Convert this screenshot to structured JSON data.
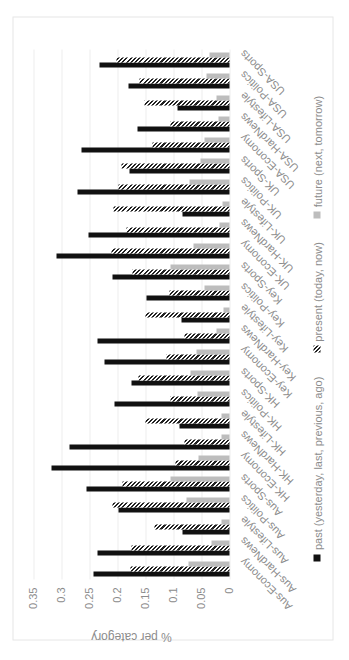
{
  "chart_data": {
    "type": "bar",
    "orientation_note": "figure rotated 90 degrees",
    "title": "",
    "xlabel": "",
    "ylabel": "% per category",
    "ylim": [
      0,
      0.35
    ],
    "yticks": [
      "0",
      "0.05",
      "0.1",
      "0.15",
      "0.2",
      "0.25",
      "0.3",
      "0.35"
    ],
    "grid": true,
    "legend_position": "bottom",
    "categories": [
      "Aus-Economy",
      "Aus-HardNews",
      "Aus-Lifestyle",
      "Aus-Politics",
      "Aus-Sports",
      "HK-Economy",
      "HK-HardNews",
      "HK-Lifestyle",
      "HK-Politics",
      "HK-Sports",
      "Key-Economy",
      "Key-HardNews",
      "Key-Lifestyle",
      "Key-Politics",
      "Key-Sports",
      "UK-Economy",
      "UK-HardNews",
      "UK-Lifestyle",
      "UK-Politics",
      "UK-Sports",
      "USA-Economy",
      "USA-HardNews",
      "USA-Lifestyle",
      "USA-Politics",
      "USA-Sports"
    ],
    "series": [
      {
        "name": "past (yesterday, last, previous, ago)",
        "color": "#111111",
        "values": [
          0.242,
          0.236,
          0.084,
          0.198,
          0.255,
          0.318,
          0.286,
          0.09,
          0.205,
          0.175,
          0.223,
          0.236,
          0.086,
          0.149,
          0.209,
          0.309,
          0.252,
          0.084,
          0.271,
          0.179,
          0.265,
          0.164,
          0.093,
          0.18,
          0.232
        ]
      },
      {
        "name": "present (today, now)",
        "color": "#222222",
        "pattern": "diagonal-hatch",
        "values": [
          0.177,
          0.175,
          0.134,
          0.209,
          0.191,
          0.096,
          0.08,
          0.15,
          0.105,
          0.163,
          0.113,
          0.08,
          0.15,
          0.107,
          0.173,
          0.211,
          0.184,
          0.207,
          0.198,
          0.193,
          0.138,
          0.105,
          0.152,
          0.161,
          0.202
        ]
      },
      {
        "name": "future (next, tomorrow)",
        "color": "#bdbdbd",
        "values": [
          0.073,
          0.032,
          0.015,
          0.077,
          0.106,
          0.055,
          0.014,
          0.015,
          0.057,
          0.07,
          0.059,
          0.024,
          0.011,
          0.045,
          0.106,
          0.064,
          0.017,
          0.013,
          0.071,
          0.052,
          0.045,
          0.02,
          0.024,
          0.041,
          0.036
        ]
      }
    ]
  }
}
